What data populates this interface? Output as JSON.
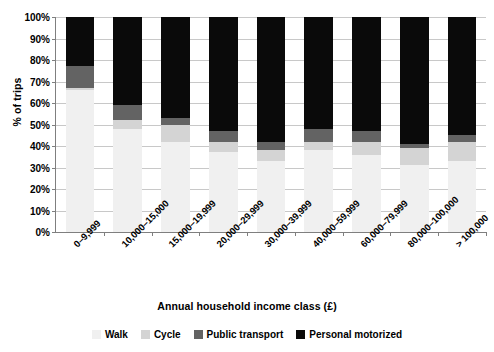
{
  "chart_data": {
    "type": "bar",
    "subtype": "stacked-percent-column",
    "title": "",
    "xlabel": "Annual household income class (£)",
    "ylabel": "% of trips",
    "ylim": [
      0,
      100
    ],
    "yticks": [
      0,
      10,
      20,
      30,
      40,
      50,
      60,
      70,
      80,
      90,
      100
    ],
    "ytick_labels": [
      "0%",
      "10%",
      "20%",
      "30%",
      "40%",
      "50%",
      "60%",
      "70%",
      "80%",
      "90%",
      "100%"
    ],
    "grid": true,
    "legend_position": "bottom",
    "categories": [
      "0–9,999",
      "10,000–15,000",
      "15,000–19,999",
      "20,000–29,999",
      "30,000–39,999",
      "40,000–59,999",
      "60,000–79,999",
      "80,000–100,000",
      "> 100,000"
    ],
    "series": [
      {
        "name": "Walk",
        "color": "#f0f0f0",
        "values": [
          66,
          48,
          42,
          37,
          33,
          38,
          36,
          31,
          33
        ]
      },
      {
        "name": "Cycle",
        "color": "#d4d4d4",
        "values": [
          1,
          4,
          8,
          5,
          5,
          4,
          6,
          8,
          9
        ]
      },
      {
        "name": "Public transport",
        "color": "#636363",
        "values": [
          10,
          7,
          3,
          5,
          4,
          6,
          5,
          2,
          3
        ]
      },
      {
        "name": "Personal motorized",
        "color": "#0a0a0a",
        "values": [
          23,
          41,
          47,
          53,
          58,
          52,
          53,
          59,
          55
        ]
      }
    ]
  },
  "axes": {
    "y_title": "% of trips",
    "x_title": "Annual household income class (£)"
  },
  "legend": {
    "items": [
      {
        "label": "Walk",
        "color": "#f0f0f0"
      },
      {
        "label": "Cycle",
        "color": "#d4d4d4"
      },
      {
        "label": "Public transport",
        "color": "#636363"
      },
      {
        "label": "Personal motorized",
        "color": "#0a0a0a"
      }
    ]
  }
}
